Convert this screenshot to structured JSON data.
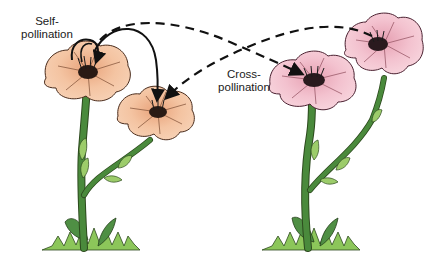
{
  "diagram": {
    "type": "pollination-illustration",
    "labels": {
      "self_line1": "Self-",
      "self_line2": "pollination",
      "cross_line1": "Cross-",
      "cross_line2": "pollination"
    },
    "plants": [
      {
        "name": "left-plant",
        "flower_color": "#f2bd98",
        "flowers": 2
      },
      {
        "name": "right-plant",
        "flower_color": "#f1bfcb",
        "flowers": 2
      }
    ],
    "arrows": [
      {
        "name": "self-pollination-arrow-1",
        "style": "solid",
        "from": "left-upper-flower",
        "to": "left-upper-flower"
      },
      {
        "name": "self-pollination-arrow-2",
        "style": "solid",
        "from": "left-upper-flower",
        "to": "left-lower-flower"
      },
      {
        "name": "cross-pollination-arrow-1",
        "style": "dashed",
        "from": "left-upper-flower",
        "to": "right-lower-flower"
      },
      {
        "name": "cross-pollination-arrow-2",
        "style": "dashed",
        "from": "right-upper-flower",
        "to": "left-lower-flower"
      }
    ],
    "colors": {
      "stem": "#4a8a3c",
      "leaf": "#9ccc6a",
      "grass": "#8cc65a",
      "peach_petal": "#f2bd98",
      "pink_petal": "#f1bfcb",
      "arrow": "#111111"
    }
  }
}
